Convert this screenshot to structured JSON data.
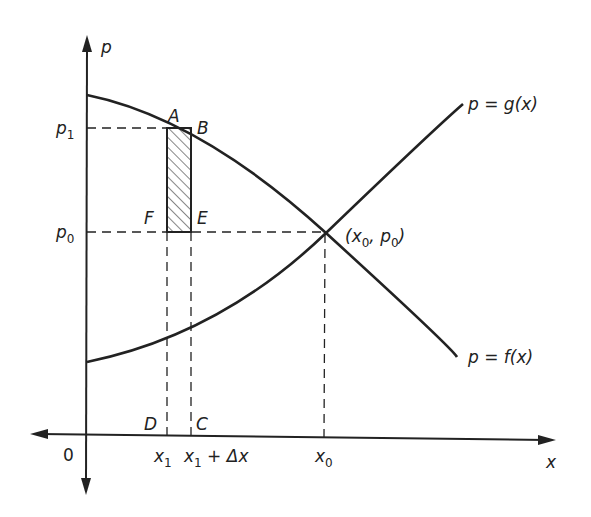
{
  "figure": {
    "axes": {
      "y_label": "p",
      "x_label": "x",
      "origin_label": "0"
    },
    "curves": [
      {
        "id": "supply",
        "label": "p = g(x)",
        "label_parts": {
          "pre": "p = g(x)"
        }
      },
      {
        "id": "demand",
        "label": "p = f(x)",
        "label_parts": {
          "pre": "p = f(x)"
        }
      }
    ],
    "equilibrium": {
      "label": "(x0, p0)",
      "x": "x",
      "x_sub": "0",
      "p": "p",
      "p_sub": "0"
    },
    "y_ticks": [
      {
        "base": "p",
        "sub": "1"
      },
      {
        "base": "p",
        "sub": "0"
      }
    ],
    "x_ticks": [
      {
        "base": "x",
        "sub": "1"
      },
      {
        "base": "x",
        "sub": "1",
        "suffix": " + Δx"
      },
      {
        "base": "x",
        "sub": "0"
      }
    ],
    "points": {
      "A": "A",
      "B": "B",
      "C": "C",
      "D": "D",
      "E": "E",
      "F": "F"
    },
    "colors": {
      "ink": "#222222",
      "background": "#ffffff"
    }
  }
}
